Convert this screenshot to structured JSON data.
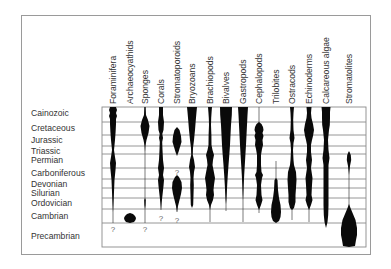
{
  "diagram": {
    "title": "",
    "grid": {
      "left": 102,
      "right": 366,
      "top": 107,
      "bottom": 247,
      "line_color": "#8a8a8a"
    },
    "periods": [
      {
        "label": "Cainozoic",
        "top": 107,
        "bottom": 122
      },
      {
        "label": "Cretaceous",
        "top": 122,
        "bottom": 135
      },
      {
        "label": "Jurassic",
        "top": 135,
        "bottom": 146
      },
      {
        "label": "Triassic",
        "top": 146,
        "bottom": 154
      },
      {
        "label": "Permian",
        "top": 154,
        "bottom": 168
      },
      {
        "label": "Carboniferous",
        "top": 168,
        "bottom": 179
      },
      {
        "label": "Devonian",
        "top": 179,
        "bottom": 188
      },
      {
        "label": "Silurian",
        "top": 188,
        "bottom": 198
      },
      {
        "label": "Ordovician",
        "top": 198,
        "bottom": 209
      },
      {
        "label": "Cambrian",
        "top": 209,
        "bottom": 223
      },
      {
        "label": "Precambrian",
        "top": 223,
        "bottom": 247
      }
    ],
    "period_label_y": [
      113,
      128,
      140,
      151,
      160,
      173,
      184,
      193,
      203,
      216,
      236
    ],
    "taxa": [
      {
        "label": "Foraminifera",
        "x": 113
      },
      {
        "label": "Archaeocyathids",
        "x": 130
      },
      {
        "label": "Sponges",
        "x": 145
      },
      {
        "label": "Corals",
        "x": 161
      },
      {
        "label": "Stromatoporoids",
        "x": 177
      },
      {
        "label": "Bryozoans",
        "x": 192
      },
      {
        "label": "Brachiopods",
        "x": 210
      },
      {
        "label": "Bivalves",
        "x": 226
      },
      {
        "label": "Gastropods",
        "x": 243
      },
      {
        "label": "Cephalopods",
        "x": 259
      },
      {
        "label": "Trilobites",
        "x": 276
      },
      {
        "label": "Ostracods",
        "x": 292
      },
      {
        "label": "Echinoderms",
        "x": 309
      },
      {
        "label": "Calcareous algae",
        "x": 326
      },
      {
        "label": "Stromatolites",
        "x": 349
      }
    ],
    "uncertain_markers": [
      {
        "symbol": "?",
        "x": 113,
        "y": 229
      },
      {
        "symbol": "?",
        "x": 145,
        "y": 229
      },
      {
        "symbol": "?",
        "x": 161,
        "y": 218
      },
      {
        "symbol": "?",
        "x": 177,
        "y": 220
      },
      {
        "symbol": "?",
        "x": 177,
        "y": 172
      }
    ],
    "spindles": [
      {
        "taxon": "Foraminifera",
        "x": 113,
        "line": [
          107,
          223
        ],
        "profile": [
          [
            107,
            3
          ],
          [
            110,
            4
          ],
          [
            113,
            3
          ],
          [
            116,
            4
          ],
          [
            119,
            3
          ],
          [
            124,
            3
          ],
          [
            132,
            2.6
          ],
          [
            140,
            2
          ],
          [
            150,
            1
          ],
          [
            157,
            2
          ],
          [
            163,
            3
          ],
          [
            170,
            2.5
          ],
          [
            180,
            1.5
          ],
          [
            192,
            1
          ],
          [
            205,
            0.4
          ],
          [
            212,
            0
          ]
        ]
      },
      {
        "taxon": "Archaeocyathids",
        "x": 130,
        "line": null,
        "profile": [
          [
            213,
            0
          ],
          [
            214,
            3
          ],
          [
            216,
            5
          ],
          [
            218,
            6
          ],
          [
            220,
            5.5
          ],
          [
            222,
            4
          ],
          [
            223,
            0
          ]
        ]
      },
      {
        "taxon": "Sponges",
        "x": 145,
        "line": [
          107,
          223
        ],
        "profile": [
          [
            107,
            0.6
          ],
          [
            115,
            1
          ],
          [
            120,
            3
          ],
          [
            126,
            4.5
          ],
          [
            133,
            3.5
          ],
          [
            140,
            1.5
          ],
          [
            146,
            0.4
          ],
          [
            152,
            0
          ],
          [
            198,
            0
          ],
          [
            200,
            0.8
          ],
          [
            205,
            0.6
          ],
          [
            209,
            0
          ]
        ]
      },
      {
        "taxon": "Corals",
        "x": 161,
        "line": [
          107,
          210
        ],
        "profile": [
          [
            107,
            2
          ],
          [
            115,
            2
          ],
          [
            122,
            3
          ],
          [
            130,
            2.5
          ],
          [
            134,
            1.3
          ],
          [
            138,
            2
          ],
          [
            142,
            1.2
          ],
          [
            150,
            1.5
          ],
          [
            160,
            2
          ],
          [
            168,
            3
          ],
          [
            175,
            2
          ],
          [
            180,
            3
          ],
          [
            186,
            2.5
          ],
          [
            195,
            1.5
          ],
          [
            203,
            0.6
          ],
          [
            210,
            0
          ]
        ]
      },
      {
        "taxon": "Stromatoporoids",
        "x": 177,
        "line": [
          190,
          212
        ],
        "profile": [
          [
            127,
            0
          ],
          [
            130,
            2.5
          ],
          [
            136,
            4
          ],
          [
            142,
            4.5
          ],
          [
            147,
            3
          ],
          [
            152,
            1.5
          ],
          [
            156,
            0
          ],
          [
            175,
            0
          ],
          [
            177,
            2
          ],
          [
            182,
            4.5
          ],
          [
            188,
            5
          ],
          [
            194,
            4
          ],
          [
            200,
            2.5
          ],
          [
            206,
            1
          ],
          [
            212,
            0
          ]
        ]
      },
      {
        "taxon": "Bryozoans",
        "x": 192,
        "line": null,
        "profile": [
          [
            107,
            5
          ],
          [
            112,
            4.5
          ],
          [
            120,
            3.8
          ],
          [
            130,
            3
          ],
          [
            140,
            2
          ],
          [
            148,
            1
          ],
          [
            155,
            0.8
          ],
          [
            160,
            2
          ],
          [
            167,
            3
          ],
          [
            172,
            2
          ],
          [
            178,
            1.5
          ],
          [
            185,
            1.8
          ],
          [
            195,
            1.5
          ],
          [
            205,
            1.2
          ],
          [
            208,
            0
          ]
        ]
      },
      {
        "taxon": "Brachiopods",
        "x": 210,
        "line": [
          107,
          222
        ],
        "profile": [
          [
            107,
            2
          ],
          [
            112,
            1.6
          ],
          [
            118,
            1.2
          ],
          [
            125,
            1
          ],
          [
            135,
            1.4
          ],
          [
            145,
            1.5
          ],
          [
            150,
            2.5
          ],
          [
            155,
            4
          ],
          [
            160,
            3
          ],
          [
            165,
            2.5
          ],
          [
            170,
            3.5
          ],
          [
            178,
            5
          ],
          [
            185,
            4
          ],
          [
            190,
            3.5
          ],
          [
            195,
            4
          ],
          [
            200,
            3
          ],
          [
            205,
            1
          ],
          [
            210,
            0
          ]
        ]
      },
      {
        "taxon": "Bivalves",
        "x": 226,
        "line": [
          107,
          211
        ],
        "profile": [
          [
            107,
            6
          ],
          [
            115,
            5.8
          ],
          [
            125,
            5
          ],
          [
            135,
            4.5
          ],
          [
            145,
            4
          ],
          [
            155,
            3.3
          ],
          [
            165,
            2.5
          ],
          [
            175,
            1.8
          ],
          [
            185,
            1.2
          ],
          [
            193,
            0.8
          ],
          [
            200,
            0.4
          ],
          [
            204,
            0
          ]
        ]
      },
      {
        "taxon": "Gastropods",
        "x": 243,
        "line": [
          107,
          222
        ],
        "profile": [
          [
            107,
            5
          ],
          [
            115,
            4.5
          ],
          [
            125,
            4
          ],
          [
            135,
            3.5
          ],
          [
            145,
            3
          ],
          [
            155,
            2.4
          ],
          [
            165,
            1.8
          ],
          [
            175,
            1.2
          ],
          [
            185,
            0.7
          ],
          [
            195,
            0.3
          ],
          [
            200,
            0
          ]
        ]
      },
      {
        "taxon": "Cephalopods",
        "x": 259,
        "line": [
          107,
          213
        ],
        "profile": [
          [
            122,
            0
          ],
          [
            124,
            2.5
          ],
          [
            127,
            4
          ],
          [
            130,
            4.5
          ],
          [
            133,
            3.5
          ],
          [
            136,
            4.5
          ],
          [
            140,
            3.5
          ],
          [
            145,
            4
          ],
          [
            149,
            3
          ],
          [
            155,
            2
          ],
          [
            165,
            2
          ],
          [
            172,
            2.5
          ],
          [
            175,
            4
          ],
          [
            178,
            3
          ],
          [
            185,
            2
          ],
          [
            195,
            2.5
          ],
          [
            200,
            3.5
          ],
          [
            205,
            2
          ],
          [
            210,
            0
          ]
        ]
      },
      {
        "taxon": "Trilobites",
        "x": 276,
        "line": [
          161,
          222
        ],
        "profile": [
          [
            178,
            0
          ],
          [
            180,
            1.5
          ],
          [
            190,
            2
          ],
          [
            198,
            3
          ],
          [
            205,
            4.5
          ],
          [
            212,
            5
          ],
          [
            217,
            4.5
          ],
          [
            221,
            3
          ],
          [
            223,
            0
          ]
        ]
      },
      {
        "taxon": "Ostracods",
        "x": 292,
        "line": [
          107,
          220
        ],
        "profile": [
          [
            107,
            2
          ],
          [
            113,
            1.5
          ],
          [
            120,
            1.2
          ],
          [
            130,
            1.5
          ],
          [
            138,
            2.5
          ],
          [
            143,
            1.5
          ],
          [
            150,
            1
          ],
          [
            160,
            1.5
          ],
          [
            165,
            2
          ],
          [
            172,
            4
          ],
          [
            180,
            4.5
          ],
          [
            188,
            4
          ],
          [
            195,
            3.5
          ],
          [
            202,
            3.5
          ],
          [
            208,
            2
          ],
          [
            210,
            0
          ]
        ]
      },
      {
        "taxon": "Echinoderms",
        "x": 309,
        "line": [
          107,
          222
        ],
        "profile": [
          [
            107,
            2.5
          ],
          [
            113,
            2
          ],
          [
            118,
            2.5
          ],
          [
            124,
            4
          ],
          [
            130,
            5
          ],
          [
            136,
            4
          ],
          [
            140,
            3
          ],
          [
            145,
            2
          ],
          [
            152,
            2
          ],
          [
            160,
            3
          ],
          [
            168,
            2
          ],
          [
            178,
            3.5
          ],
          [
            185,
            3
          ],
          [
            195,
            2.5
          ],
          [
            200,
            3.5
          ],
          [
            205,
            2
          ],
          [
            210,
            0
          ]
        ]
      },
      {
        "taxon": "Calcareous algae",
        "x": 326,
        "line": null,
        "profile": [
          [
            107,
            4.5
          ],
          [
            112,
            4
          ],
          [
            118,
            4
          ],
          [
            125,
            3.8
          ],
          [
            130,
            3
          ],
          [
            135,
            2.5
          ],
          [
            140,
            2
          ],
          [
            150,
            2.5
          ],
          [
            158,
            3.5
          ],
          [
            165,
            2.5
          ],
          [
            175,
            2.5
          ],
          [
            185,
            2.5
          ],
          [
            195,
            2.5
          ],
          [
            205,
            2.5
          ],
          [
            215,
            2.2
          ],
          [
            222,
            1.5
          ],
          [
            228,
            0
          ]
        ]
      },
      {
        "taxon": "Stromatolites",
        "x": 349,
        "line": [
          152,
          225
        ],
        "profile": [
          [
            151,
            0
          ],
          [
            155,
            1.8
          ],
          [
            160,
            2.2
          ],
          [
            166,
            1
          ],
          [
            172,
            0.3
          ],
          [
            175,
            0
          ],
          [
            204,
            0
          ],
          [
            208,
            1.5
          ],
          [
            214,
            4
          ],
          [
            220,
            6.5
          ],
          [
            228,
            8
          ],
          [
            235,
            8
          ],
          [
            240,
            7
          ],
          [
            246,
            6
          ],
          [
            247,
            0
          ]
        ]
      }
    ]
  }
}
